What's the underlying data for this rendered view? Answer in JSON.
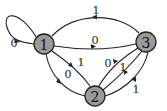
{
  "diagram": {
    "type": "state-transition-graph",
    "nodes": [
      {
        "id": "1",
        "label": "1"
      },
      {
        "id": "2",
        "label": "2"
      },
      {
        "id": "3",
        "label": "3"
      }
    ],
    "edges": [
      {
        "from": "1",
        "to": "1",
        "label": "0"
      },
      {
        "from": "3",
        "to": "1",
        "label": "1"
      },
      {
        "from": "1",
        "to": "3",
        "label": "0"
      },
      {
        "from": "1",
        "to": "2",
        "label": "1"
      },
      {
        "from": "1",
        "to": "2",
        "label": "0"
      },
      {
        "from": "2",
        "to": "3",
        "label": "0"
      },
      {
        "from": "2",
        "to": "3",
        "label": "1"
      },
      {
        "from": "3",
        "to": "2",
        "label": "1"
      }
    ]
  }
}
